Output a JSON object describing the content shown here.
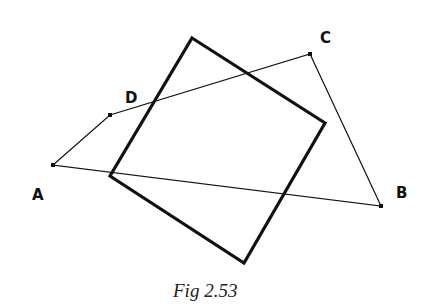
{
  "figure": {
    "caption": "Fig 2.53",
    "points": {
      "A": {
        "label": "A",
        "x": 53,
        "y": 165,
        "label_x": 32,
        "label_y": 200
      },
      "B": {
        "label": "B",
        "x": 381,
        "y": 206,
        "label_x": 396,
        "label_y": 198
      },
      "C": {
        "label": "C",
        "x": 310,
        "y": 54,
        "label_x": 320,
        "label_y": 43
      },
      "D": {
        "label": "D",
        "x": 110,
        "y": 115,
        "label_x": 125,
        "label_y": 103
      }
    },
    "quadrilateral_ADCB": "53,165 110,115 310,54 381,206",
    "square": "192,38 325,123 244,263 110,176",
    "colors": {
      "line": "#111111",
      "background": "#ffffff"
    }
  }
}
